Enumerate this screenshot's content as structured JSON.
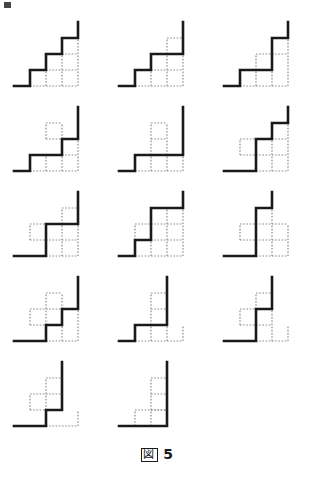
{
  "figure": {
    "caption_label": "図",
    "caption_number": "5",
    "caption_full": "図 5",
    "columns": 3,
    "rows": 5,
    "panel_count": 14
  },
  "style": {
    "solid_color": "#1a1a1a",
    "dotted_color": "#8c8c8c",
    "background": "#ffffff",
    "solid_width": 2.6,
    "dotted_width": 1.2,
    "dash_pattern": "1.6 1.6",
    "unit": 16,
    "origin_x": 14,
    "origin_y": 74
  },
  "panels": [
    {
      "index": 1,
      "name": "panel-r1c1",
      "solid_path": "M0,0 L1,0 L1,1 L2,1 L2,2 L3,2 L3,3 L4,3 L4,4",
      "dotted_segments": [
        "M1,0 L4,0",
        "M2,1 L4,1",
        "M3,2 L4,2",
        "M2,0 L2,1",
        "M3,0 L3,2",
        "M4,0 L4,3"
      ]
    },
    {
      "index": 2,
      "name": "panel-r1c2",
      "solid_path": "M0,0 L1,0 L1,1 L2,1 L2,2 L4,2 L4,4",
      "dotted_segments": [
        "M1,0 L4,0",
        "M2,1 L4,1",
        "M3,2 L3,3",
        "M3,3 L4,3",
        "M2,0 L2,1",
        "M3,0 L3,2",
        "M4,0 L4,2"
      ]
    },
    {
      "index": 3,
      "name": "panel-r1c3",
      "solid_path": "M0,0 L1,0 L1,1 L3,1 L3,3 L4,3 L4,4",
      "dotted_segments": [
        "M1,0 L4,0",
        "M2,1 L2,2",
        "M2,2 L3,2",
        "M3,2 L4,2",
        "M2,0 L2,1",
        "M3,0 L3,1",
        "M4,0 L4,3"
      ]
    },
    {
      "index": 4,
      "name": "panel-r2c1",
      "solid_path": "M0,0 L1,0 L1,1 L3,1 L3,2 L4,2 L4,4",
      "dotted_segments": [
        "M1,0 L4,0",
        "M2,1 L4,1",
        "M2,2 L3,2",
        "M2,2 L2,3",
        "M2,3 L3,3",
        "M2,0 L2,1",
        "M3,0 L3,1",
        "M4,0 L4,2",
        "M3,2 L3,3"
      ]
    },
    {
      "index": 5,
      "name": "panel-r2c2",
      "solid_path": "M0,0 L1,0 L1,1 L4,1 L4,4",
      "dotted_segments": [
        "M1,0 L4,0",
        "M2,1 L3,1",
        "M2,1 L2,3",
        "M3,1 L3,3",
        "M2,2 L3,2",
        "M2,3 L3,3",
        "M2,0 L2,1",
        "M3,0 L3,1",
        "M4,0 L4,1"
      ]
    },
    {
      "index": 6,
      "name": "panel-r2c3",
      "solid_path": "M0,0 L2,0 L2,2 L3,2 L3,3 L4,3 L4,4",
      "dotted_segments": [
        "M2,0 L4,0",
        "M1,1 L2,1",
        "M1,1 L1,2",
        "M1,2 L2,2",
        "M2,1 L4,1",
        "M3,2 L4,2",
        "M3,0 L3,2",
        "M4,0 L4,3",
        "M2,2 L2,0"
      ]
    },
    {
      "index": 7,
      "name": "panel-r3c1",
      "solid_path": "M0,0 L2,0 L2,2 L4,2 L4,4",
      "dotted_segments": [
        "M2,0 L4,0",
        "M1,1 L4,1",
        "M1,1 L1,2",
        "M1,2 L2,2",
        "M3,0 L3,2",
        "M4,0 L4,2",
        "M3,2 L3,3",
        "M3,3 L4,3",
        "M4,2 L4,3"
      ]
    },
    {
      "index": 8,
      "name": "panel-r3c2",
      "solid_path": "M0,0 L1,0 L1,1 L2,1 L2,3 L4,3 L4,4",
      "dotted_segments": [
        "M1,0 L4,0",
        "M2,1 L4,1",
        "M2,2 L4,2",
        "M1,1 L1,2",
        "M1,2 L2,2",
        "M2,0 L2,1",
        "M3,0 L3,3",
        "M4,0 L4,3"
      ]
    },
    {
      "index": 9,
      "name": "panel-r3c3",
      "solid_path": "M0,0 L2,0 L2,3 L3,3 L3,4",
      "dotted_segments": [
        "M2,0 L4,0",
        "M1,1 L4,1",
        "M1,1 L1,2",
        "M1,2 L2,2",
        "M2,2 L4,2",
        "M2,1 L2,2",
        "M4,0 L4,2",
        "M3,0 L3,3",
        "M2,3 L3,3"
      ]
    },
    {
      "index": 10,
      "name": "panel-r4c1",
      "solid_path": "M0,0 L2,0 L2,1 L3,1 L3,2 L4,2 L4,4",
      "dotted_segments": [
        "M2,0 L4,0",
        "M1,1 L2,1",
        "M1,1 L1,2",
        "M1,2 L3,2",
        "M2,1 L3,1",
        "M2,1 L2,3",
        "M3,2 L3,3",
        "M2,3 L3,3",
        "M4,0 L4,2",
        "M3,0 L3,1"
      ]
    },
    {
      "index": 11,
      "name": "panel-r4c2",
      "solid_path": "M0,0 L1,0 L1,1 L3,1 L3,4",
      "dotted_segments": [
        "M1,0 L4,0",
        "M2,1 L3,1",
        "M2,1 L2,3",
        "M2,2 L3,2",
        "M2,3 L3,3",
        "M2,0 L2,1",
        "M3,0 L3,1",
        "M4,0 L4,1",
        "M3,1 L3,3"
      ]
    },
    {
      "index": 12,
      "name": "panel-r4c3",
      "solid_path": "M0,0 L2,0 L2,2 L3,2 L3,4",
      "dotted_segments": [
        "M2,0 L4,0",
        "M1,1 L3,1",
        "M1,1 L1,2",
        "M1,2 L2,2",
        "M2,2 L3,2",
        "M2,1 L2,2",
        "M3,0 L3,2",
        "M4,0 L4,1",
        "M2,2 L2,3",
        "M2,3 L3,3"
      ]
    },
    {
      "index": 13,
      "name": "panel-r5c1",
      "solid_path": "M0,0 L2,0 L2,1 L3,1 L3,4",
      "dotted_segments": [
        "M2,0 L4,0",
        "M1,1 L3,1",
        "M1,1 L1,2",
        "M1,2 L2,2",
        "M2,2 L2,3",
        "M2,2 L3,2",
        "M2,3 L3,3",
        "M2,1 L2,2",
        "M3,1 L3,3",
        "M4,0 L4,1"
      ]
    },
    {
      "index": 14,
      "name": "panel-r5c2",
      "solid_path": "M0,0 L3,0 L3,4",
      "dotted_segments": [
        "M1,0 L1,1",
        "M1,1 L3,1",
        "M2,0 L2,3",
        "M2,1 L3,1",
        "M2,2 L3,2",
        "M2,3 L3,3",
        "M3,0 L3,3"
      ]
    }
  ]
}
